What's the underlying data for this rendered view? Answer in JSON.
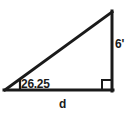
{
  "diagram": {
    "type": "right-triangle",
    "labels": {
      "angle": "26.25",
      "height": "6'",
      "base": "d"
    },
    "colors": {
      "stroke": "#1a1a1a",
      "background": "#ffffff",
      "text": "#1a1a1a"
    },
    "geometry": {
      "left_vertex": [
        5,
        90
      ],
      "right_vertex": [
        112,
        90
      ],
      "top_vertex": [
        112,
        12
      ],
      "stroke_width": 3,
      "right_angle_marker_size": 10,
      "angle_tick": [
        20,
        90,
        20,
        79
      ]
    }
  }
}
